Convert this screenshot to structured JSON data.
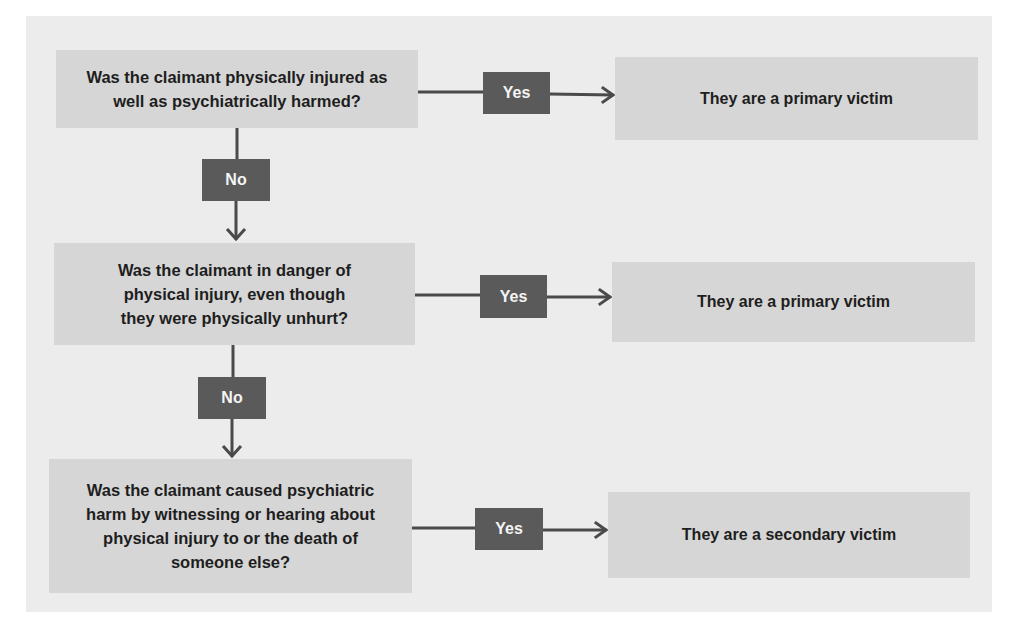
{
  "flowchart": {
    "questions": [
      {
        "text": "Was the claimant physically injured as well as psychiatrically harmed?"
      },
      {
        "text": "Was the claimant in danger of physical injury, even though they were physically unhurt?"
      },
      {
        "text": "Was the claimant caused psychiatric harm by witnessing or hearing about physical injury to or the death of someone else?"
      }
    ],
    "outcomes": [
      {
        "text": "They are a primary victim"
      },
      {
        "text": "They are a primary victim"
      },
      {
        "text": "They are a secondary victim"
      }
    ],
    "yes_label": "Yes",
    "no_label": "No",
    "colors": {
      "background": "#ececec",
      "box_fill": "#d6d6d6",
      "tag_fill": "#5a5a5a",
      "connector": "#4a4a4a"
    }
  }
}
